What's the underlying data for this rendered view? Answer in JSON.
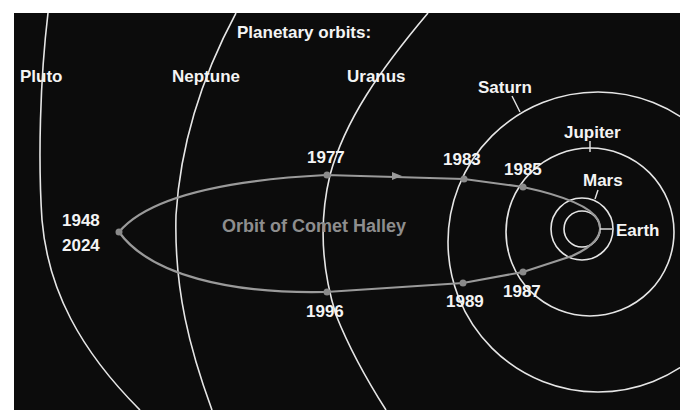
{
  "title": "Planetary orbits:",
  "planets": [
    {
      "name": "Pluto"
    },
    {
      "name": "Neptune"
    },
    {
      "name": "Uranus"
    },
    {
      "name": "Saturn"
    },
    {
      "name": "Jupiter"
    },
    {
      "name": "Mars"
    },
    {
      "name": "Earth"
    }
  ],
  "comet": {
    "label": "Orbit of Comet Halley",
    "aphelion_years": [
      "1948",
      "2024"
    ],
    "positions": [
      {
        "year": "1977",
        "crossing": "Uranus",
        "side": "inbound"
      },
      {
        "year": "1983",
        "crossing": "Saturn",
        "side": "inbound"
      },
      {
        "year": "1985",
        "crossing": "Jupiter",
        "side": "inbound"
      },
      {
        "year": "1987",
        "crossing": "Jupiter",
        "side": "outbound"
      },
      {
        "year": "1989",
        "crossing": "Saturn",
        "side": "outbound"
      },
      {
        "year": "1996",
        "crossing": "Uranus",
        "side": "outbound"
      }
    ]
  },
  "colors": {
    "background": "#0c0c0c",
    "orbit_lines": "#e6e6e6",
    "comet_orbit": "#9a9a9a",
    "labels": "#f4f4f4"
  }
}
